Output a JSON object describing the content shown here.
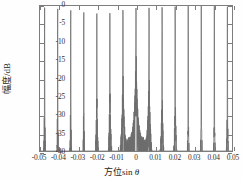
{
  "figure": {
    "background": "#ffffff",
    "axis_color": "#7d7d7d",
    "curve_color": "#6f6f6f"
  },
  "axes": {
    "xlabel_prefix": "方位sin ",
    "xlabel_symbol": "θ",
    "ylabel": "幅度/dB",
    "xticks": [
      -0.05,
      -0.04,
      -0.03,
      -0.02,
      -0.01,
      0,
      0.01,
      0.02,
      0.03,
      0.04,
      0.05
    ],
    "xtick_labels": [
      "-0.05",
      "-0.04",
      "-0.03",
      "-0.02",
      "-0.01",
      "0",
      "0.01",
      "0.02",
      "0.03",
      "0.04",
      "0.05"
    ],
    "yticks": [
      0,
      -5,
      -10,
      -15,
      -20,
      -25,
      -30,
      -35,
      -40
    ],
    "ytick_labels": [
      "0",
      "-5",
      "-10",
      "-15",
      "-20",
      "-25",
      "-30",
      "-35",
      "-40"
    ]
  },
  "chart_data": {
    "type": "line",
    "title": "",
    "xlabel": "方位sin θ",
    "ylabel": "幅度/dB",
    "xlim": [
      -0.05,
      0.05
    ],
    "ylim": [
      -40,
      0
    ],
    "grid": false,
    "legend": null,
    "series": [
      {
        "name": "beam pattern",
        "color": "#6f6f6f",
        "main_lobe_peak_db": 0,
        "main_lobe_center": 0,
        "main_lobe_null_half_width": 0.0034,
        "first_sidelobe_db": -13.3,
        "sidelobe_peaks": [
          {
            "x": -0.0485,
            "y": -29.5
          },
          {
            "x": -0.0449,
            "y": -28.0
          },
          {
            "x": -0.0415,
            "y": -30.0
          },
          {
            "x": -0.038,
            "y": -31.0
          },
          {
            "x": -0.0345,
            "y": -29.6
          },
          {
            "x": -0.0311,
            "y": -29.0
          },
          {
            "x": -0.0277,
            "y": -30.5
          },
          {
            "x": -0.0242,
            "y": -26.5
          },
          {
            "x": -0.0208,
            "y": -25.5
          },
          {
            "x": -0.0174,
            "y": -26.8
          },
          {
            "x": -0.0139,
            "y": -24.5
          },
          {
            "x": -0.0105,
            "y": -22.0
          },
          {
            "x": -0.0071,
            "y": -19.5
          },
          {
            "x": -0.0055,
            "y": -18.0
          },
          {
            "x": -0.0038,
            "y": -13.3
          },
          {
            "x": 0.0038,
            "y": -13.3
          },
          {
            "x": 0.0055,
            "y": -18.0
          },
          {
            "x": 0.0071,
            "y": -19.5
          },
          {
            "x": 0.0105,
            "y": -22.0
          },
          {
            "x": 0.0139,
            "y": -24.5
          },
          {
            "x": 0.0174,
            "y": -26.8
          },
          {
            "x": 0.0208,
            "y": -25.5
          },
          {
            "x": 0.0242,
            "y": -26.5
          },
          {
            "x": 0.0277,
            "y": -30.5
          },
          {
            "x": 0.0311,
            "y": -29.0
          },
          {
            "x": 0.0345,
            "y": -29.6
          },
          {
            "x": 0.038,
            "y": -31.0
          },
          {
            "x": 0.0415,
            "y": -30.0
          },
          {
            "x": 0.0449,
            "y": -28.0
          },
          {
            "x": 0.0485,
            "y": -29.5
          }
        ]
      }
    ]
  }
}
